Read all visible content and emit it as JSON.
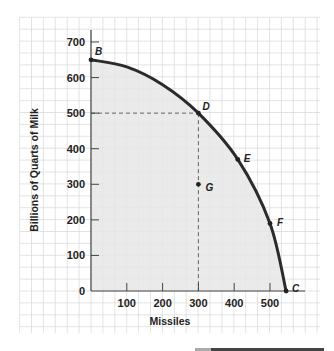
{
  "chart_data": {
    "type": "line",
    "title": "",
    "xlabel": "Missiles",
    "ylabel": "Billions of  Quarts of Milk",
    "xlim": [
      0,
      600
    ],
    "ylim": [
      0,
      750
    ],
    "x_ticks": [
      100,
      200,
      300,
      400,
      500
    ],
    "x_tick_labels": [
      "100",
      "200",
      "300",
      "400",
      "500"
    ],
    "y_ticks": [
      0,
      100,
      200,
      300,
      400,
      500,
      600,
      700
    ],
    "y_tick_labels": [
      "0",
      "100",
      "200",
      "300",
      "400",
      "500",
      "600",
      "700"
    ],
    "grid": true,
    "legend": null,
    "series": [
      {
        "name": "Production possibilities frontier",
        "x": [
          0,
          100,
          200,
          300,
          410,
          500,
          545
        ],
        "y": [
          650,
          630,
          580,
          500,
          370,
          190,
          0
        ]
      }
    ],
    "points": [
      {
        "label": "B",
        "x": 0,
        "y": 650
      },
      {
        "label": "D",
        "x": 300,
        "y": 500
      },
      {
        "label": "E",
        "x": 410,
        "y": 370
      },
      {
        "label": "F",
        "x": 500,
        "y": 190
      },
      {
        "label": "C",
        "x": 545,
        "y": 0
      },
      {
        "label": "G",
        "x": 300,
        "y": 300
      }
    ],
    "annotations": [
      {
        "type": "dashed-guide",
        "from": [
          0,
          500
        ],
        "to": [
          300,
          500
        ]
      },
      {
        "type": "dashed-guide",
        "from": [
          300,
          500
        ],
        "to": [
          300,
          0
        ]
      },
      {
        "type": "shaded-region",
        "description": "area under frontier (attainable set)"
      }
    ],
    "colors": {
      "curve": "#2b2b2b",
      "shade": "#e6e6e6",
      "grid": "#dcdcdc",
      "axis": "#444444"
    }
  }
}
